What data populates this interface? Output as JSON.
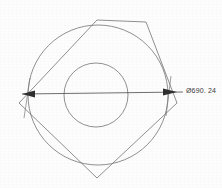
{
  "drawing": {
    "title": "Pentagon with concentric circles - diameter dimension",
    "background_color": "#fdfdfd",
    "line_color": "#6b6b6b",
    "dimension_color": "#4a4a4a",
    "text_color": "#3a3a3a",
    "dimension": {
      "label": "Ø690. 24",
      "symbol": "Ø",
      "value": "690. 24",
      "numeric_value": 690.24,
      "text_x": 186,
      "text_y": 87
    },
    "geometry": {
      "outer_circle": {
        "cx": 98,
        "cy": 95,
        "r": 70
      },
      "inner_circle": {
        "cx": 96,
        "cy": 95,
        "r": 32
      },
      "pentagon_points": "97,20 146,22 177,103 97,178 19,103",
      "dimension_line": {
        "x1": 22,
        "y1": 94,
        "x2": 183,
        "y2": 92
      },
      "arrow_left": "22,94 34,91 34,97",
      "arrow_right": "176,92 163,89 163,96",
      "extension_left": {
        "x1": 30,
        "y1": 78,
        "x2": 24,
        "y2": 118
      },
      "extension_right": {
        "x1": 171,
        "y1": 76,
        "x2": 166,
        "y2": 116
      }
    }
  }
}
